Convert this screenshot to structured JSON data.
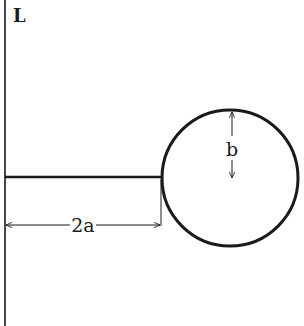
{
  "diagram": {
    "labels": {
      "line": "L",
      "distance": "2a",
      "radius": "b"
    },
    "colors": {
      "stroke": "#1a1a1a",
      "background": "#ffffff"
    },
    "geometry": {
      "line_L_x": 5,
      "rod_y": 177,
      "circle_center": [
        230,
        178
      ],
      "circle_radius": 68,
      "dimension_y": 225
    }
  }
}
